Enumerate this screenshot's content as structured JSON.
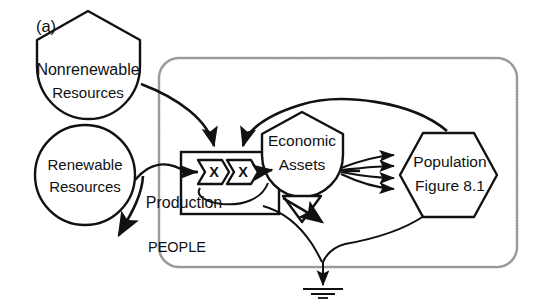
{
  "figure": {
    "panel_label": "(a)",
    "boundary_label": "PEOPLE",
    "line_color": "#111111",
    "boundary_color": "#9a9a9a",
    "background": "#ffffff"
  },
  "nodes": {
    "nonrenewable": {
      "label_line1": "Nonrenewable",
      "label_line2": "Resources",
      "shape": "tank"
    },
    "renewable": {
      "label_line1": "Renewable",
      "label_line2": "Resources",
      "shape": "circle"
    },
    "economic_assets": {
      "label_line1": "Economic",
      "label_line2": "Assets",
      "shape": "tank"
    },
    "population": {
      "label_line1": "Population",
      "label_line2": "Figure  8.1",
      "shape": "hexagon"
    },
    "production": {
      "label": "Production",
      "shape": "box",
      "multiplier1": "X",
      "multiplier2": "X"
    }
  },
  "diagram_data": {
    "type": "systems-energy-diagram",
    "boundary": "PEOPLE",
    "flows": [
      {
        "from": "nonrenewable",
        "to": "production-multiplier-1",
        "style": "curved-arrow"
      },
      {
        "from": "renewable",
        "to": "production",
        "style": "curved-arrow"
      },
      {
        "from": "renewable",
        "to": "sink",
        "style": "curved-arrow-out"
      },
      {
        "from": "population",
        "to": "production-multiplier-2",
        "style": "feedback-loop"
      },
      {
        "from": "production",
        "to": "economic_assets",
        "style": "arrow"
      },
      {
        "from": "economic_assets",
        "to": "population",
        "style": "multi-arrow-fan",
        "count": 4
      },
      {
        "from": "economic_assets",
        "to": "production",
        "style": "feedback-loop"
      },
      {
        "from": "economic_assets",
        "to": "depreciation-sink",
        "style": "arrow"
      },
      {
        "from": "population",
        "to": "ground-sink",
        "style": "curved-arrow"
      }
    ]
  }
}
